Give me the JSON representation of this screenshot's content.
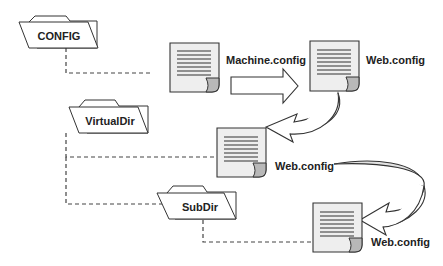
{
  "diagram": {
    "folders": [
      {
        "id": "config",
        "label": "CONFIG"
      },
      {
        "id": "virtualdir",
        "label": "VirtualDir"
      },
      {
        "id": "subdir",
        "label": "SubDir"
      }
    ],
    "documents": [
      {
        "id": "machine-config-doc",
        "label": "Machine.config"
      },
      {
        "id": "root-web-config-doc",
        "label": "Web.config"
      },
      {
        "id": "virtualdir-web-config-doc",
        "label": "Web.config"
      },
      {
        "id": "subdir-web-config-doc",
        "label": "Web.config"
      }
    ],
    "connectors": [
      {
        "from": "CONFIG",
        "to": "Machine.config",
        "style": "dashed"
      },
      {
        "from": "VirtualDir",
        "to": "Web.config (VirtualDir)",
        "style": "dashed"
      },
      {
        "from": "VirtualDir",
        "to": "SubDir",
        "style": "dashed"
      },
      {
        "from": "SubDir",
        "to": "Web.config (SubDir)",
        "style": "dashed"
      }
    ],
    "arrows": [
      {
        "from": "Machine.config",
        "to": "Web.config (root)",
        "shape": "block-right"
      },
      {
        "from": "Web.config (root)",
        "to": "Web.config (VirtualDir)",
        "shape": "curved"
      },
      {
        "from": "Web.config (VirtualDir)",
        "to": "Web.config (SubDir)",
        "shape": "curved"
      }
    ],
    "colors": {
      "document_fill": "#eeeeee",
      "curl_fill": "#b8b8b8",
      "arrow_shade": "#e2e2e2",
      "stroke": "#333333"
    }
  }
}
